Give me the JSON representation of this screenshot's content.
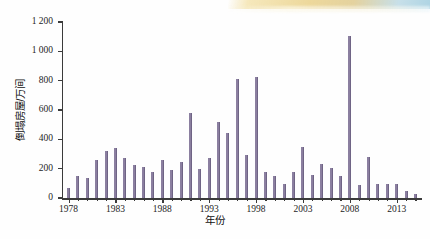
{
  "figure": {
    "background_color": "#ffffff",
    "bar_color": "#8b7fa0",
    "axis_color": "#3b3b3b"
  },
  "chart_data": {
    "type": "bar",
    "title": "",
    "xlabel": "年份",
    "ylabel": "倒塌房屋/万间",
    "ylim": [
      0,
      1200
    ],
    "ytick_labels": [
      "0",
      "200",
      "400",
      "600",
      "800",
      "1 000",
      "1 200"
    ],
    "ytick_values": [
      0,
      200,
      400,
      600,
      800,
      1000,
      1200
    ],
    "xtick_labels": [
      "1978",
      "1983",
      "1988",
      "1993",
      "1998",
      "2003",
      "2008",
      "2013"
    ],
    "xtick_values": [
      1978,
      1983,
      1988,
      1993,
      1998,
      2003,
      2008,
      2013
    ],
    "xlim": [
      1977.3,
      2015.7
    ],
    "grid": false,
    "legend": null,
    "categories": [
      1978,
      1979,
      1980,
      1981,
      1982,
      1983,
      1984,
      1985,
      1986,
      1987,
      1988,
      1989,
      1990,
      1991,
      1992,
      1993,
      1994,
      1995,
      1996,
      1997,
      1998,
      1999,
      2000,
      2001,
      2002,
      2003,
      2004,
      2005,
      2006,
      2007,
      2008,
      2009,
      2010,
      2011,
      2012,
      2013,
      2014,
      2015
    ],
    "values": [
      65,
      150,
      135,
      260,
      320,
      342,
      275,
      223,
      212,
      180,
      258,
      192,
      248,
      580,
      200,
      275,
      515,
      443,
      812,
      290,
      825,
      178,
      152,
      98,
      178,
      348,
      160,
      232,
      202,
      152,
      1102,
      90,
      280,
      98,
      95,
      95,
      45,
      30
    ]
  }
}
